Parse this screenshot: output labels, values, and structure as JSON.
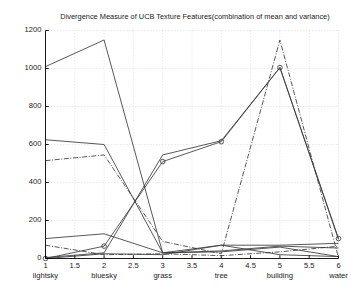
{
  "figure": {
    "background": "#ffffff",
    "axes_color": "#000000",
    "grid_color": "#bdbdbd",
    "line_color": "#3a3a3a"
  },
  "chart_data": {
    "type": "line",
    "title": "Divergence Measure of UCB Texture Features(combination of mean and variance)",
    "xlabel": "",
    "ylabel": "",
    "xlim": [
      1,
      6
    ],
    "ylim": [
      0,
      1200
    ],
    "grid": true,
    "legend": "none",
    "x": [
      1,
      2,
      3,
      4,
      5,
      6
    ],
    "xticks": [
      1,
      1.5,
      2,
      2.5,
      3,
      3.5,
      4,
      4.5,
      5,
      5.5,
      6
    ],
    "xticklabels": [
      "1",
      "1.5",
      "2",
      "2.5",
      "3",
      "3.5",
      "4",
      "4.5",
      "5",
      "5.5",
      "6"
    ],
    "xcategories": [
      "lightsky",
      "bluesky",
      "grass",
      "tree",
      "building",
      "water"
    ],
    "xcategory_positions": [
      1,
      2,
      3,
      4,
      5,
      6
    ],
    "yticks": [
      0,
      200,
      400,
      600,
      800,
      1000,
      1200
    ],
    "yticklabels": [
      "0",
      "200",
      "400",
      "600",
      "800",
      "1000",
      "1200"
    ],
    "series": [
      {
        "name": "lightsky",
        "style": "solid",
        "marker": "none",
        "values": [
          1010,
          1150,
          30,
          35,
          60,
          10
        ]
      },
      {
        "name": "bluesky",
        "style": "solid",
        "marker": "none",
        "values": [
          625,
          600,
          30,
          40,
          65,
          55
        ]
      },
      {
        "name": "grass",
        "style": "dashdot",
        "marker": "none",
        "values": [
          515,
          545,
          90,
          25,
          1150,
          5
        ]
      },
      {
        "name": "tree",
        "style": "solid",
        "marker": "circle",
        "values": [
          0,
          65,
          510,
          615,
          1005,
          105
        ]
      },
      {
        "name": "building",
        "style": "solid",
        "marker": "none",
        "values": [
          5,
          30,
          545,
          620,
          1005,
          100
        ]
      },
      {
        "name": "water",
        "style": "solid",
        "marker": "none",
        "values": [
          105,
          130,
          30,
          70,
          70,
          80
        ]
      },
      {
        "name": "aux-1",
        "style": "dashdot",
        "marker": "none",
        "values": [
          70,
          20,
          25,
          15,
          35,
          65
        ]
      },
      {
        "name": "aux-2",
        "style": "solid",
        "marker": "none",
        "values": [
          0,
          25,
          20,
          70,
          20,
          10
        ]
      }
    ]
  }
}
